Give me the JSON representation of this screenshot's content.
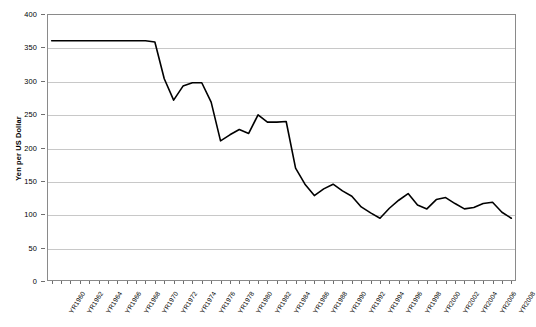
{
  "chart_data": {
    "type": "line",
    "title": "",
    "xlabel": "",
    "ylabel": "Yen per US Dollar",
    "ylim": [
      0,
      400
    ],
    "ytick_step": 50,
    "yticks": [
      0,
      50,
      100,
      150,
      200,
      250,
      300,
      350,
      400
    ],
    "ytick_labels": [
      "0",
      "50",
      "100",
      "150",
      "200",
      "250",
      "300",
      "350",
      "400"
    ],
    "grid": true,
    "legend": "none",
    "line_color": "#000000",
    "xtick_label_step": 2,
    "xtick_labels": [
      "YR1960",
      "YR1962",
      "YR1964",
      "YR1966",
      "YR1968",
      "YR1970",
      "YR1972",
      "YR1974",
      "YR1976",
      "YR1978",
      "YR1980",
      "YR1982",
      "YR1984",
      "YR1986",
      "YR1988",
      "YR1990",
      "YR1992",
      "YR1994",
      "YR1996",
      "YR1998",
      "YR2000",
      "YR2002",
      "YR2004",
      "YR2006",
      "YR2008"
    ],
    "categories": [
      "YR1960",
      "YR1961",
      "YR1962",
      "YR1963",
      "YR1964",
      "YR1965",
      "YR1966",
      "YR1967",
      "YR1968",
      "YR1969",
      "YR1970",
      "YR1971",
      "YR1972",
      "YR1973",
      "YR1974",
      "YR1975",
      "YR1976",
      "YR1977",
      "YR1978",
      "YR1979",
      "YR1980",
      "YR1981",
      "YR1982",
      "YR1983",
      "YR1984",
      "YR1985",
      "YR1986",
      "YR1987",
      "YR1988",
      "YR1989",
      "YR1990",
      "YR1991",
      "YR1992",
      "YR1993",
      "YR1994",
      "YR1995",
      "YR1996",
      "YR1997",
      "YR1998",
      "YR1999",
      "YR2000",
      "YR2001",
      "YR2002",
      "YR2003",
      "YR2004",
      "YR2005",
      "YR2006",
      "YR2007",
      "YR2008",
      "YR2009"
    ],
    "values": [
      360,
      360,
      360,
      360,
      360,
      360,
      360,
      360,
      360,
      360,
      360,
      358,
      303,
      271,
      292,
      297,
      297,
      268,
      210,
      219,
      227,
      221,
      249,
      238,
      238,
      239,
      169,
      145,
      128,
      138,
      145,
      135,
      127,
      111,
      102,
      94,
      109,
      121,
      131,
      114,
      108,
      122,
      125,
      116,
      108,
      110,
      116,
      118,
      103,
      94
    ]
  }
}
